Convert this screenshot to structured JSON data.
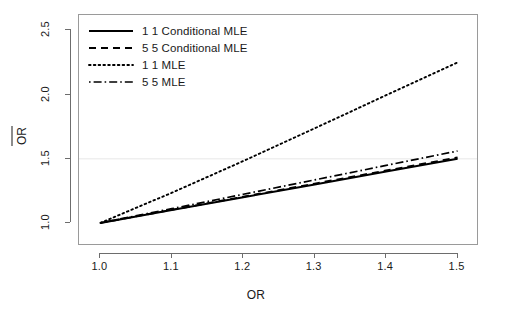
{
  "chart_data": {
    "type": "line",
    "title": "",
    "xlabel": "OR",
    "ylabel": "OR̂",
    "ylabel_plain": "OR",
    "xlim": [
      0.97,
      1.53
    ],
    "ylim": [
      0.82,
      2.62
    ],
    "xticks": [
      "1.0",
      "1.1",
      "1.2",
      "1.3",
      "1.4",
      "1.5"
    ],
    "xtick_values": [
      1.0,
      1.1,
      1.2,
      1.3,
      1.4,
      1.5
    ],
    "yticks": [
      "1.0",
      "1.5",
      "2.0",
      "2.5"
    ],
    "ytick_values": [
      1.0,
      1.5,
      2.0,
      2.5
    ],
    "grid": "horizontal-reference-line-at-1.5",
    "gridline_color": "#efefef",
    "legend_position": "top-left",
    "x": [
      1.0,
      1.1,
      1.2,
      1.3,
      1.4,
      1.5
    ],
    "series": [
      {
        "name": "1 1 Conditional MLE",
        "style": "solid",
        "color": "#000000",
        "values": [
          1.0,
          1.1,
          1.2,
          1.3,
          1.4,
          1.5
        ]
      },
      {
        "name": "5 5 Conditional MLE",
        "style": "dashed",
        "color": "#000000",
        "values": [
          1.0,
          1.102,
          1.204,
          1.306,
          1.408,
          1.51
        ]
      },
      {
        "name": "1 1 MLE",
        "style": "dotted",
        "color": "#000000",
        "values": [
          1.0,
          1.235,
          1.482,
          1.737,
          1.995,
          2.25
        ]
      },
      {
        "name": "5 5 MLE",
        "style": "dashdot",
        "color": "#000000",
        "values": [
          1.0,
          1.111,
          1.223,
          1.335,
          1.448,
          1.56
        ]
      }
    ]
  },
  "legend": {
    "items": [
      {
        "label": "1 1 Conditional MLE",
        "style": "solid"
      },
      {
        "label": "5 5 Conditional MLE",
        "style": "dashed"
      },
      {
        "label": "1 1 MLE",
        "style": "dotted"
      },
      {
        "label": "5 5 MLE",
        "style": "dashdot"
      }
    ]
  }
}
